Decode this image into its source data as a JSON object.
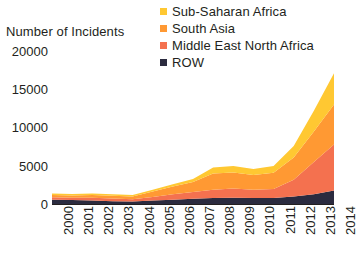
{
  "chart_data": {
    "type": "area",
    "stacked": true,
    "title": "",
    "xlabel": "",
    "ylabel": "Number of Incidents",
    "x": [
      2000,
      2001,
      2002,
      2003,
      2004,
      2005,
      2006,
      2007,
      2008,
      2009,
      2010,
      2011,
      2012,
      2013,
      2014
    ],
    "categories": [
      "2000",
      "2001",
      "2002",
      "2003",
      "2004",
      "2005",
      "2006",
      "2007",
      "2008",
      "2009",
      "2010",
      "2011",
      "2012",
      "2013",
      "2014"
    ],
    "xtick_labels": [
      "2000",
      "2001",
      "2002",
      "2003",
      "2004",
      "2005",
      "2006",
      "2007",
      "2008",
      "2009",
      "2010",
      "2011",
      "2012",
      "2013",
      "2014"
    ],
    "ytick_labels": [
      "20000",
      "15000",
      "10000",
      "5000",
      "0"
    ],
    "yticks": [
      20000,
      15000,
      10000,
      5000,
      0
    ],
    "ylim": [
      0,
      21000
    ],
    "grid": false,
    "legend_position": "top-right",
    "stack_order_bottom_to_top": [
      "ROW",
      "Middle East North Africa",
      "South Asia",
      "Sub-Saharan Africa"
    ],
    "series": [
      {
        "name": "ROW",
        "color": "#2b2b3f",
        "values": [
          700,
          650,
          600,
          500,
          450,
          600,
          700,
          800,
          900,
          950,
          900,
          900,
          1100,
          1400,
          1900
        ]
      },
      {
        "name": "Middle East North Africa",
        "color": "#f4714f",
        "values": [
          300,
          300,
          350,
          350,
          300,
          450,
          700,
          900,
          1100,
          1200,
          1100,
          1200,
          2200,
          4200,
          6000
        ]
      },
      {
        "name": "South Asia",
        "color": "#ff9933",
        "values": [
          300,
          300,
          350,
          350,
          350,
          700,
          1000,
          1300,
          2100,
          2100,
          1900,
          2100,
          2900,
          4000,
          5200
        ]
      },
      {
        "name": "Sub-Saharan Africa",
        "color": "#ffc832",
        "values": [
          200,
          200,
          200,
          200,
          200,
          250,
          300,
          400,
          800,
          850,
          800,
          900,
          1500,
          2700,
          4100
        ]
      }
    ],
    "totals": [
      1500,
      1450,
      1500,
      1400,
      1300,
      2000,
      2700,
      3400,
      4900,
      5100,
      4700,
      5100,
      7700,
      12300,
      17200
    ]
  },
  "legend": {
    "items": [
      {
        "label": "Sub-Saharan Africa",
        "color": "#ffc832",
        "swatch": "legend-swatch-icon"
      },
      {
        "label": "South Asia",
        "color": "#ff9933",
        "swatch": "legend-swatch-icon"
      },
      {
        "label": "Middle East North Africa",
        "color": "#f4714f",
        "swatch": "legend-swatch-icon"
      },
      {
        "label": "ROW",
        "color": "#2b2b3f",
        "swatch": "legend-swatch-icon"
      }
    ]
  },
  "axes": {
    "y_title": "Number of Incidents",
    "y_ticks": [
      {
        "label": "20000",
        "value": 20000
      },
      {
        "label": "15000",
        "value": 15000
      },
      {
        "label": "10000",
        "value": 10000
      },
      {
        "label": "5000",
        "value": 5000
      },
      {
        "label": "0",
        "value": 0
      }
    ],
    "x_ticks": [
      {
        "label": "2000"
      },
      {
        "label": "2001"
      },
      {
        "label": "2002"
      },
      {
        "label": "2003"
      },
      {
        "label": "2004"
      },
      {
        "label": "2005"
      },
      {
        "label": "2006"
      },
      {
        "label": "2007"
      },
      {
        "label": "2008"
      },
      {
        "label": "2009"
      },
      {
        "label": "2010"
      },
      {
        "label": "2011"
      },
      {
        "label": "2012"
      },
      {
        "label": "2013"
      },
      {
        "label": "2014"
      }
    ]
  }
}
